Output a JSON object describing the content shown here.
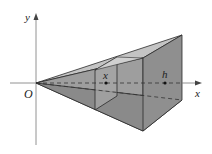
{
  "diagram": {
    "labels": {
      "y_axis": "y",
      "x_axis": "x",
      "origin": "O",
      "cross_section": "x",
      "height": "h"
    },
    "colors": {
      "face_dark": "#8f8f8f",
      "face_mid": "#a9a9a9",
      "face_light": "#c4c4c4",
      "edge": "#2a2a2a",
      "axis": "#555555"
    }
  }
}
